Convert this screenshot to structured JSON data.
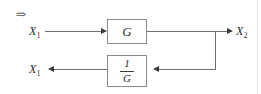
{
  "diagram": {
    "type": "block-diagram",
    "title": "",
    "annotation": {
      "implies_symbol": "⇒"
    },
    "blocks": [
      {
        "id": "forward",
        "label": "G",
        "kind": "gain"
      },
      {
        "id": "feedback",
        "numerator": "1",
        "denominator": "G",
        "kind": "inverse-gain"
      }
    ],
    "signals": {
      "input": {
        "base": "X",
        "subscript": "1",
        "text": "X"
      },
      "output": {
        "base": "X",
        "subscript": "2",
        "text": "X"
      },
      "feedback_output": {
        "base": "X",
        "subscript": "1",
        "text": "X"
      }
    },
    "colors": {
      "stroke": "#6f6f6f",
      "arrow": "#3a3a3a",
      "block_border": "#8a8a8a",
      "text": "#2b2b2b",
      "background": "#ffffff",
      "frame_rule": "#e2e2e2"
    }
  }
}
